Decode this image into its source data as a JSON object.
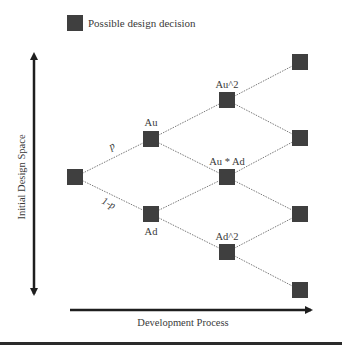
{
  "legend": {
    "swatch_color": "#3f3f3f",
    "label": "Possible design decision"
  },
  "axes": {
    "vertical_label": "Initial Design Space",
    "horizontal_label": "Development Process"
  },
  "edges_labels": {
    "up": "p",
    "down": "1-p"
  },
  "nodes": [
    {
      "id": "root",
      "label": "",
      "x": 75,
      "y": 177
    },
    {
      "id": "au",
      "label": "Au",
      "x": 151,
      "y": 139
    },
    {
      "id": "ad",
      "label": "Ad",
      "x": 151,
      "y": 214
    },
    {
      "id": "au2",
      "label": "Au^2",
      "x": 227,
      "y": 100
    },
    {
      "id": "auad",
      "label": "Au * Ad",
      "x": 227,
      "y": 177
    },
    {
      "id": "ad2",
      "label": "Ad^2",
      "x": 227,
      "y": 252
    },
    {
      "id": "r1",
      "label": "",
      "x": 300,
      "y": 62
    },
    {
      "id": "r2",
      "label": "",
      "x": 300,
      "y": 138
    },
    {
      "id": "r3",
      "label": "",
      "x": 300,
      "y": 214
    },
    {
      "id": "r4",
      "label": "",
      "x": 300,
      "y": 290
    }
  ],
  "colors": {
    "node": "#3f3f3f",
    "edge": "#7a7a7a",
    "arrow": "#1e1e1e"
  }
}
